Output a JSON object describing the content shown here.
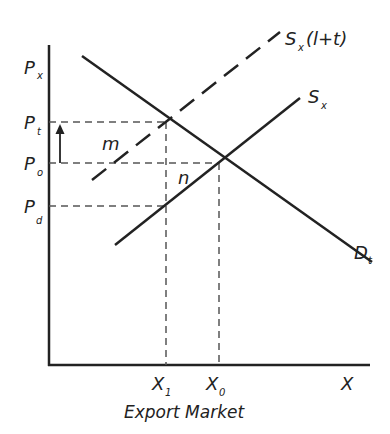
{
  "diagram": {
    "title": "Export Market",
    "y_axis": {
      "label": "P",
      "label_sub": "x",
      "ticks": [
        {
          "main": "P",
          "sub": "t",
          "name": "price-tariff"
        },
        {
          "main": "P",
          "sub": "o",
          "name": "price-original"
        },
        {
          "main": "P",
          "sub": "d",
          "name": "price-domestic"
        }
      ]
    },
    "x_axis": {
      "label": "X",
      "ticks": [
        {
          "main": "X",
          "sub": "1",
          "name": "quantity-after-tariff"
        },
        {
          "main": "X",
          "sub": "0",
          "name": "quantity-original"
        }
      ]
    },
    "curves": {
      "supply_tariff": {
        "main": "S",
        "sub": "x",
        "suffix": "(l+t)"
      },
      "supply": {
        "main": "S",
        "sub": "x"
      },
      "demand": {
        "main": "D",
        "sub": "t"
      }
    },
    "areas": {
      "m": "m",
      "n": "n"
    },
    "colors": {
      "line": "#222222",
      "dash": "#555555",
      "background": "#ffffff"
    }
  }
}
